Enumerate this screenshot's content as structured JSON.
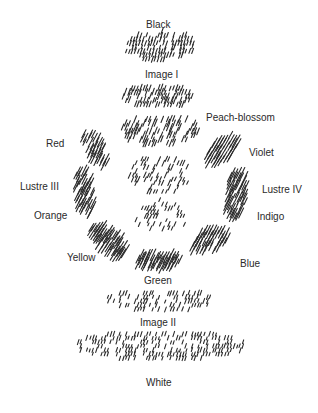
{
  "diagram": {
    "type": "hatched ring diagram of colour regions around a central figure",
    "ink_color": "#2a2a2a",
    "background_color": "#ffffff",
    "labels": [
      {
        "id": "black",
        "text": "Black",
        "x": 146,
        "y": 20
      },
      {
        "id": "image-i",
        "text": "Image I",
        "x": 145,
        "y": 70
      },
      {
        "id": "peach-blossom",
        "text": "Peach-blossom",
        "x": 206,
        "y": 113
      },
      {
        "id": "red",
        "text": "Red",
        "x": 46,
        "y": 139
      },
      {
        "id": "violet",
        "text": "Violet",
        "x": 249,
        "y": 148
      },
      {
        "id": "lustre-iii",
        "text": "Lustre III",
        "x": 20,
        "y": 182
      },
      {
        "id": "lustre-iv",
        "text": "Lustre IV",
        "x": 262,
        "y": 185
      },
      {
        "id": "orange",
        "text": "Orange",
        "x": 34,
        "y": 211
      },
      {
        "id": "indigo",
        "text": "Indigo",
        "x": 257,
        "y": 212
      },
      {
        "id": "yellow",
        "text": "Yellow",
        "x": 67,
        "y": 253
      },
      {
        "id": "blue",
        "text": "Blue",
        "x": 240,
        "y": 259
      },
      {
        "id": "green",
        "text": "Green",
        "x": 144,
        "y": 276
      },
      {
        "id": "image-ii",
        "text": "Image II",
        "x": 140,
        "y": 318
      },
      {
        "id": "white",
        "text": "White",
        "x": 146,
        "y": 378
      }
    ],
    "regions": [
      {
        "name": "black-band",
        "cx": 160,
        "cy": 46,
        "w": 72,
        "h": 30,
        "angle": 70,
        "len": 6,
        "density": 0.75,
        "skew": -0.15
      },
      {
        "name": "image-i-band",
        "cx": 158,
        "cy": 96,
        "w": 70,
        "h": 24,
        "angle": 70,
        "len": 7,
        "density": 0.7,
        "skew": 0.05
      },
      {
        "name": "upper-figure",
        "cx": 160,
        "cy": 130,
        "w": 80,
        "h": 30,
        "angle": 68,
        "len": 8,
        "density": 0.55,
        "skew": 0
      },
      {
        "name": "red-band",
        "cx": 96,
        "cy": 148,
        "w": 24,
        "h": 36,
        "angle": 62,
        "len": 11,
        "density": 0.8,
        "skew": 0.4
      },
      {
        "name": "violet-band",
        "cx": 222,
        "cy": 150,
        "w": 30,
        "h": 30,
        "angle": 60,
        "len": 11,
        "density": 0.85,
        "skew": -0.6
      },
      {
        "name": "lustre-iii-band",
        "cx": 84,
        "cy": 192,
        "w": 20,
        "h": 50,
        "angle": 64,
        "len": 12,
        "density": 0.85,
        "skew": 0.1
      },
      {
        "name": "lustre-iv-band",
        "cx": 236,
        "cy": 194,
        "w": 22,
        "h": 50,
        "angle": 64,
        "len": 12,
        "density": 0.85,
        "skew": -0.1
      },
      {
        "name": "face-center",
        "cx": 160,
        "cy": 175,
        "w": 60,
        "h": 40,
        "angle": 66,
        "len": 6,
        "density": 0.45,
        "skew": 0
      },
      {
        "name": "chin-rings",
        "cx": 160,
        "cy": 215,
        "w": 60,
        "h": 30,
        "angle": 66,
        "len": 5,
        "density": 0.35,
        "skew": 0
      },
      {
        "name": "yellow-band",
        "cx": 108,
        "cy": 240,
        "w": 28,
        "h": 34,
        "angle": 58,
        "len": 14,
        "density": 0.9,
        "skew": 0.7
      },
      {
        "name": "blue-band",
        "cx": 210,
        "cy": 240,
        "w": 34,
        "h": 28,
        "angle": 64,
        "len": 12,
        "density": 0.85,
        "skew": -0.6
      },
      {
        "name": "green-band",
        "cx": 158,
        "cy": 260,
        "w": 46,
        "h": 18,
        "angle": 64,
        "len": 13,
        "density": 0.9,
        "skew": 0
      },
      {
        "name": "image-ii-rows",
        "cx": 160,
        "cy": 300,
        "w": 110,
        "h": 22,
        "angle": 70,
        "len": 5,
        "density": 0.55,
        "skew": 0
      },
      {
        "name": "white-rows",
        "cx": 160,
        "cy": 345,
        "w": 170,
        "h": 30,
        "angle": 72,
        "len": 5,
        "density": 0.6,
        "skew": 0
      }
    ]
  }
}
